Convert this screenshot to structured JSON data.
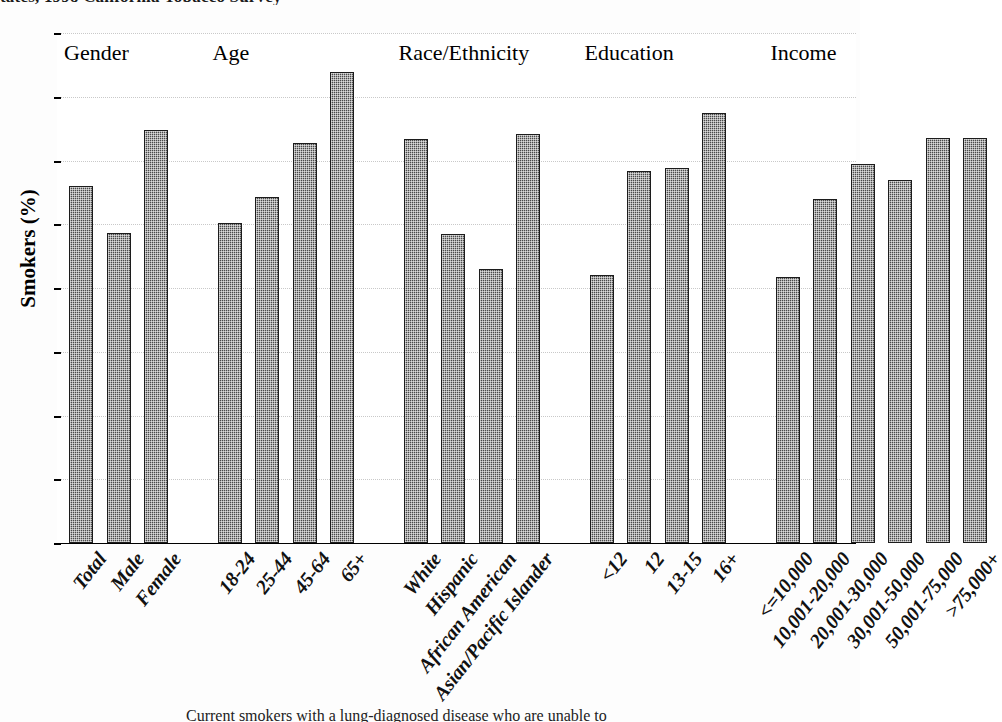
{
  "figure": {
    "title_clipped": "tates, 1998 California Tobacco Survey",
    "caption_clipped": "Current smokers with a lung-diagnosed disease who are unable to"
  },
  "chart_data": {
    "type": "bar",
    "title": "",
    "xlabel": "",
    "ylabel": "Smokers (%)",
    "ylim": [
      0,
      80
    ],
    "ytick_step": 10,
    "ytick_labels": [
      "0",
      "10",
      "20",
      "30",
      "40",
      "50",
      "60",
      "70",
      "80"
    ],
    "grid": true,
    "legend": "none",
    "bar_color": "#4a4a4a",
    "groups": [
      {
        "name": "Gender",
        "categories": [
          "Total",
          "Male",
          "Female"
        ],
        "values": [
          56.0,
          48.6,
          64.8
        ]
      },
      {
        "name": "Age",
        "categories": [
          "18-24",
          "25-44",
          "45-64",
          "65+"
        ],
        "values": [
          50.2,
          54.3,
          62.8,
          73.9
        ]
      },
      {
        "name": "Race/Ethnicity",
        "categories": [
          "White",
          "Hispanic",
          "African American",
          "Asian/Pacific Islander"
        ],
        "values": [
          63.4,
          48.5,
          43.0,
          64.2
        ]
      },
      {
        "name": "Education",
        "categories": [
          "<12",
          "12",
          "13-15",
          "16+"
        ],
        "values": [
          42.1,
          58.3,
          58.8,
          67.4
        ]
      },
      {
        "name": "Income",
        "categories": [
          "<=10,000",
          "10,001-20,000",
          "20,001-30,000",
          "30,001-50,000",
          "50,001-75,000",
          ">75,000+"
        ],
        "values": [
          41.8,
          54.0,
          59.4,
          56.9,
          63.6,
          63.6
        ]
      }
    ]
  }
}
